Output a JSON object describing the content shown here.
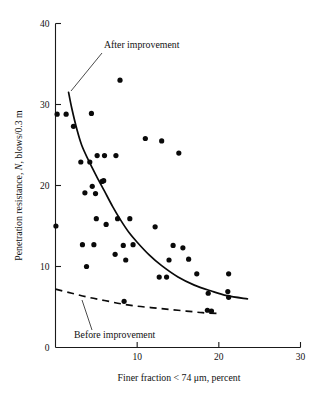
{
  "chart_data": {
    "type": "scatter",
    "title": "",
    "xlabel": "Finer fraction < 74 μm, percent",
    "ylabel_prefix": "Penetration resistance, ",
    "ylabel_italic": "N",
    "ylabel_suffix": ", blows/0.3 m",
    "ylabel": "Penetration resistance, N, blows/0.3 m",
    "xlim": [
      0,
      30
    ],
    "ylim": [
      0,
      40
    ],
    "xticks": [
      0,
      10,
      20,
      30
    ],
    "yticks": [
      0,
      10,
      20,
      30,
      40
    ],
    "xtick_labels": [
      "0",
      "10",
      "20",
      "30"
    ],
    "ytick_labels": [
      "0",
      "10",
      "20",
      "30",
      "40"
    ],
    "grid": false,
    "legend_position": "inline-annotations",
    "marker": "filled-circle",
    "marker_color": "#0a0a0a",
    "points": [
      [
        0.2,
        28.8
      ],
      [
        1.3,
        28.8
      ],
      [
        2.2,
        27.3
      ],
      [
        4.4,
        28.9
      ],
      [
        7.9,
        33.0
      ],
      [
        11.0,
        25.8
      ],
      [
        13.0,
        25.5
      ],
      [
        15.1,
        24.0
      ],
      [
        3.1,
        22.9
      ],
      [
        4.2,
        22.9
      ],
      [
        5.1,
        23.7
      ],
      [
        6.0,
        23.7
      ],
      [
        7.4,
        23.7
      ],
      [
        4.5,
        19.9
      ],
      [
        3.6,
        19.1
      ],
      [
        4.9,
        19.0
      ],
      [
        5.7,
        20.5
      ],
      [
        5.9,
        20.6
      ],
      [
        0.05,
        15.0
      ],
      [
        5.0,
        15.9
      ],
      [
        6.2,
        15.2
      ],
      [
        7.6,
        15.9
      ],
      [
        9.1,
        15.9
      ],
      [
        12.2,
        14.9
      ],
      [
        3.3,
        12.7
      ],
      [
        4.7,
        12.7
      ],
      [
        8.3,
        12.6
      ],
      [
        9.5,
        12.7
      ],
      [
        14.4,
        12.6
      ],
      [
        15.6,
        12.3
      ],
      [
        7.3,
        11.5
      ],
      [
        8.6,
        10.8
      ],
      [
        13.9,
        10.8
      ],
      [
        16.3,
        10.9
      ],
      [
        3.8,
        10.0
      ],
      [
        17.3,
        9.1
      ],
      [
        21.2,
        9.1
      ],
      [
        12.7,
        8.7
      ],
      [
        13.6,
        8.7
      ],
      [
        18.7,
        6.7
      ],
      [
        21.1,
        6.9
      ],
      [
        21.2,
        6.2
      ],
      [
        8.4,
        5.7
      ],
      [
        18.6,
        4.6
      ],
      [
        19.1,
        4.5
      ]
    ],
    "curves": [
      {
        "name": "After improvement",
        "style": "solid",
        "label": "After improvement",
        "points": [
          [
            1.6,
            31.5
          ],
          [
            2.0,
            29.5
          ],
          [
            2.6,
            27.0
          ],
          [
            3.2,
            25.0
          ],
          [
            4.0,
            23.2
          ],
          [
            5.0,
            21.2
          ],
          [
            6.0,
            19.3
          ],
          [
            7.0,
            17.4
          ],
          [
            8.0,
            15.7
          ],
          [
            9.0,
            14.2
          ],
          [
            10.0,
            13.0
          ],
          [
            11.5,
            11.4
          ],
          [
            13.0,
            10.1
          ],
          [
            15.0,
            8.7
          ],
          [
            17.0,
            7.7
          ],
          [
            19.0,
            7.0
          ],
          [
            21.0,
            6.4
          ],
          [
            23.5,
            6.0
          ]
        ]
      },
      {
        "name": "Before improvement",
        "style": "dashed",
        "label": "Before improvement",
        "points": [
          [
            0.0,
            7.2
          ],
          [
            2.0,
            6.7
          ],
          [
            4.0,
            6.2
          ],
          [
            6.0,
            5.8
          ],
          [
            8.0,
            5.4
          ],
          [
            10.0,
            5.1
          ],
          [
            12.0,
            4.9
          ],
          [
            14.0,
            4.7
          ],
          [
            16.0,
            4.5
          ],
          [
            18.0,
            4.3
          ],
          [
            20.0,
            4.2
          ]
        ]
      }
    ],
    "annotations": [
      {
        "text": "After improvement",
        "text_x_px": 104,
        "text_y_px": 48,
        "leader_from_px": [
          102,
          53
        ],
        "leader_to_px": [
          71,
          91
        ]
      },
      {
        "text": "Before improvement",
        "text_x_px": 74,
        "text_y_px": 338,
        "leader_from_px": [
          92,
          330
        ],
        "leader_to_px": [
          82,
          300
        ]
      }
    ]
  }
}
